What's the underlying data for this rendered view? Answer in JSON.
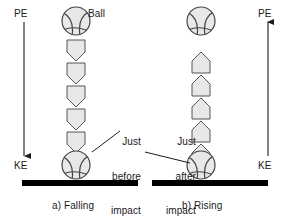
{
  "figure": {
    "background": "#ffffff",
    "ink": "#1a1a1a",
    "ground_color": "#000000",
    "ball_fill": "#e8e8e8",
    "ball_stroke": "#555555",
    "chevron_fill": "#e8e8e8",
    "chevron_stroke": "#555555"
  },
  "panels": [
    {
      "id": "falling",
      "caption": "a) Falling",
      "axis_top_label": "PE",
      "axis_bottom_label": "KE",
      "axis_direction": "down",
      "motion_direction": "down",
      "chevron_count": 5,
      "callout": "Just\nbefore\nimpact",
      "callout_lines": [
        "Just",
        "before",
        "impact"
      ],
      "ball_label": "Ball"
    },
    {
      "id": "rising",
      "caption": "b) Rising",
      "axis_top_label": "PE",
      "axis_bottom_label": "KE",
      "axis_direction": "up",
      "motion_direction": "up",
      "chevron_count": 5,
      "callout": "Just\nafter\nimpact",
      "callout_lines": [
        "Just",
        "after",
        "impact"
      ],
      "ball_label": ""
    }
  ],
  "labels": {
    "ball": "Ball",
    "pe": "PE",
    "ke": "KE",
    "caption_a": "a) Falling",
    "caption_b": "b) Rising",
    "callout_a_l1": "Just",
    "callout_a_l2": "before",
    "callout_a_l3": "impact",
    "callout_b_l1": "Just",
    "callout_b_l2": "after",
    "callout_b_l3": "impact"
  }
}
